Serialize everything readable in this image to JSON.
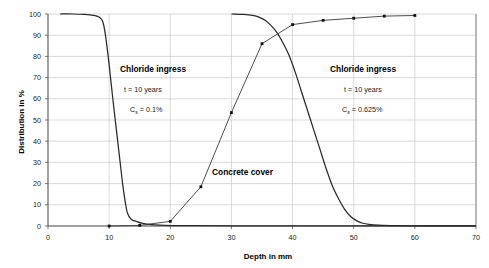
{
  "chart_data": {
    "type": "line",
    "title": "",
    "xlabel": "Depth in mm",
    "ylabel": "Distribution in %",
    "xlim": [
      0,
      70
    ],
    "ylim": [
      0,
      100
    ],
    "xticks": [
      0,
      10,
      20,
      30,
      40,
      50,
      60,
      70
    ],
    "yticks": [
      0,
      10,
      20,
      30,
      40,
      50,
      60,
      70,
      80,
      90,
      100
    ],
    "grid": true,
    "legend": "none",
    "series": [
      {
        "name": "Chloride ingress t = 10 years, Cs = 0.1%",
        "markers": false,
        "x": [
          2,
          4,
          6,
          7,
          8,
          8.6,
          9,
          9.4,
          10,
          10.6,
          11.2,
          11.8,
          12.2,
          12.6,
          13,
          13.6,
          14.4,
          15.5,
          17,
          19,
          21,
          24,
          30,
          40,
          50,
          60,
          70
        ],
        "y": [
          100,
          100,
          99.8,
          99.5,
          99,
          98,
          96,
          90,
          76,
          60,
          45,
          30,
          20,
          12,
          6,
          3.2,
          2.2,
          1.2,
          0.6,
          0.3,
          0.2,
          0.15,
          0.1,
          0.1,
          0.05,
          0.05,
          0.05
        ]
      },
      {
        "name": "Chloride ingress t = 10 years, Cs = 0.625%",
        "markers": false,
        "x": [
          30,
          32,
          33.5,
          34.5,
          35.5,
          36.5,
          37.5,
          38.5,
          39.5,
          40.5,
          41.5,
          42.5,
          43.5,
          44.5,
          45.5,
          46.5,
          47.5,
          48.5,
          49.5,
          50.5,
          51.5,
          52.5,
          54,
          56,
          58,
          62,
          70
        ],
        "y": [
          100,
          99.8,
          99.3,
          98.5,
          97,
          94.5,
          91,
          86,
          80,
          72,
          63,
          54,
          45,
          36,
          27,
          19,
          13,
          8,
          4.5,
          2.4,
          1.3,
          0.8,
          0.4,
          0.2,
          0.12,
          0.08,
          0.05
        ]
      },
      {
        "name": "Concrete cover",
        "markers": true,
        "x": [
          10,
          15,
          20,
          25,
          30,
          35,
          40,
          45,
          50,
          55,
          60
        ],
        "y": [
          0,
          0.3,
          2.2,
          18.5,
          53.5,
          86.0,
          95.0,
          97.0,
          98.0,
          99.0,
          99.3
        ]
      }
    ],
    "annotations": [
      {
        "id": "left",
        "title": "Chloride ingress",
        "line2_prefix": "t = 10 years",
        "line3_prefix": "C",
        "line3_sub": "s",
        "line3_suffix": " = 0.1%"
      },
      {
        "id": "right",
        "title": "Chloride ingress",
        "line2_prefix": "t = 10 years",
        "line3_prefix": "C",
        "line3_sub": "s",
        "line3_suffix": " = 0.625%"
      }
    ],
    "curve_label": "Concrete cover",
    "colors": {
      "curve": "#2a2a2a",
      "grid": "#c9c9c9",
      "axis": "#555555",
      "background": "#ffffff"
    }
  },
  "axis": {
    "x_title": "Depth in mm",
    "y_title": "Distribution in %",
    "x_tick_labels": [
      "0",
      "10",
      "20",
      "30",
      "40",
      "50",
      "60",
      "70"
    ],
    "y_tick_labels": [
      "0",
      "10",
      "20",
      "30",
      "40",
      "50",
      "60",
      "70",
      "80",
      "90",
      "100"
    ]
  },
  "annotation_left": {
    "title": "Chloride ingress",
    "time": "t = 10 years",
    "cs_c": "C",
    "cs_sub": "s",
    "cs_val": " = 0.1%"
  },
  "annotation_right": {
    "title": "Chloride ingress",
    "time": "t = 10 years",
    "cs_c": "C",
    "cs_sub": "s",
    "cs_val": " = 0.625%"
  },
  "curve_label": {
    "text": "Concrete cover"
  }
}
